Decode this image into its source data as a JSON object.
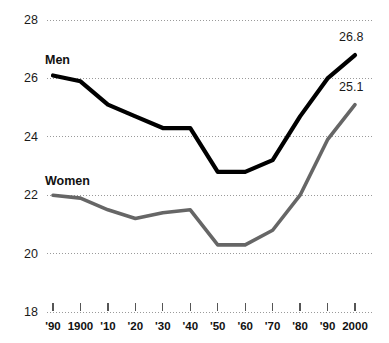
{
  "chart_data": {
    "type": "line",
    "title": "",
    "subtitle": "",
    "xlabel": "",
    "ylabel": "",
    "grid": true,
    "grid_style": "dotted-horizontal",
    "legend_position": "inline-series-labels",
    "ylim": [
      18,
      28
    ],
    "y_ticks": [
      18,
      20,
      22,
      24,
      26,
      28
    ],
    "y_tick_labels": [
      "18",
      "20",
      "22",
      "24",
      "26",
      "28"
    ],
    "x": [
      "1890",
      "1900",
      "1910",
      "1920",
      "1930",
      "1940",
      "1950",
      "1960",
      "1970",
      "1980",
      "1990",
      "2000"
    ],
    "x_tick_labels": [
      "'90",
      "1900",
      "'10",
      "'20",
      "'30",
      "'40",
      "'50",
      "'60",
      "'70",
      "'80",
      "'90",
      "2000"
    ],
    "series": [
      {
        "name": "Men",
        "color": "#000000",
        "line_width": 4.2,
        "label": "Men",
        "end_value_label": "26.8",
        "values": [
          26.1,
          25.9,
          25.1,
          24.7,
          24.3,
          24.3,
          22.8,
          22.8,
          23.2,
          24.7,
          26.0,
          26.8
        ]
      },
      {
        "name": "Women",
        "color": "#666666",
        "line_width": 3.6,
        "label": "Women",
        "end_value_label": "25.1",
        "values": [
          22.0,
          21.9,
          21.5,
          21.2,
          21.4,
          21.5,
          20.3,
          20.3,
          20.8,
          22.0,
          23.9,
          25.1
        ]
      }
    ],
    "annotations": [
      {
        "text": "Men",
        "kind": "series-label"
      },
      {
        "text": "Women",
        "kind": "series-label"
      },
      {
        "text": "26.8",
        "kind": "end-value"
      },
      {
        "text": "25.1",
        "kind": "end-value"
      }
    ],
    "colors": {
      "men_line": "#000000",
      "women_line": "#666666",
      "gridline": "#9a9a9a",
      "tick_mark": "#555555",
      "text": "#111111",
      "background": "#ffffff"
    }
  }
}
